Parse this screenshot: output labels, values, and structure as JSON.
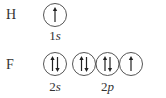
{
  "diagram": {
    "rows": [
      {
        "element": "H",
        "groups": [
          {
            "label_num": "1",
            "label_sub": "s",
            "orbitals": [
              "up"
            ]
          }
        ]
      },
      {
        "element": "F",
        "groups": [
          {
            "label_num": "2",
            "label_sub": "s",
            "orbitals": [
              "updown"
            ]
          },
          {
            "label_num": "2",
            "label_sub": "p",
            "orbitals": [
              "updown",
              "updown",
              "up"
            ]
          }
        ]
      }
    ]
  }
}
